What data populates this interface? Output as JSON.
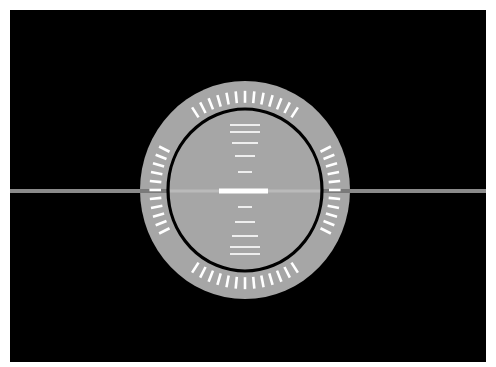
{
  "canvas": {
    "background": "#000000",
    "border": "#ffffff"
  },
  "instrument": {
    "type": "attitude-indicator",
    "center": [
      245,
      190
    ],
    "outer_radius": [
      105,
      109
    ],
    "inner_ring_radius": [
      77,
      81
    ],
    "colors": {
      "dial": "#a6a6a6",
      "ring": "#000000",
      "ticks": "#ffffff",
      "horizon_outside": "#8a8a8a",
      "horizon_inside": "#bababa",
      "horizon_on_dial": "#7a7a7a",
      "center_bar": "#ffffff"
    },
    "bezel_tick_groups": [
      {
        "name": "top",
        "center_deg": -90,
        "count": 13,
        "step_deg": 5.6
      },
      {
        "name": "bottom",
        "center_deg": 90,
        "count": 13,
        "step_deg": 5.6
      },
      {
        "name": "left",
        "center_deg": 180,
        "count": 11,
        "step_deg": 5.2
      },
      {
        "name": "right",
        "center_deg": 0,
        "count": 11,
        "step_deg": 5.2
      }
    ],
    "pitch_lines": [
      {
        "y": 125,
        "half_width": 15
      },
      {
        "y": 132,
        "half_width": 15
      },
      {
        "y": 143,
        "half_width": 13
      },
      {
        "y": 156,
        "half_width": 10
      },
      {
        "y": 172,
        "half_width": 7
      },
      {
        "y": 207,
        "half_width": 7
      },
      {
        "y": 222,
        "half_width": 10
      },
      {
        "y": 236,
        "half_width": 13
      },
      {
        "y": 247,
        "half_width": 15
      },
      {
        "y": 254,
        "half_width": 15
      }
    ],
    "center_bar": {
      "y": 191,
      "x1": 219,
      "x2": 268,
      "height": 5
    },
    "horizon": {
      "y": 191,
      "x1": 10,
      "x2": 486,
      "height": 4
    }
  }
}
